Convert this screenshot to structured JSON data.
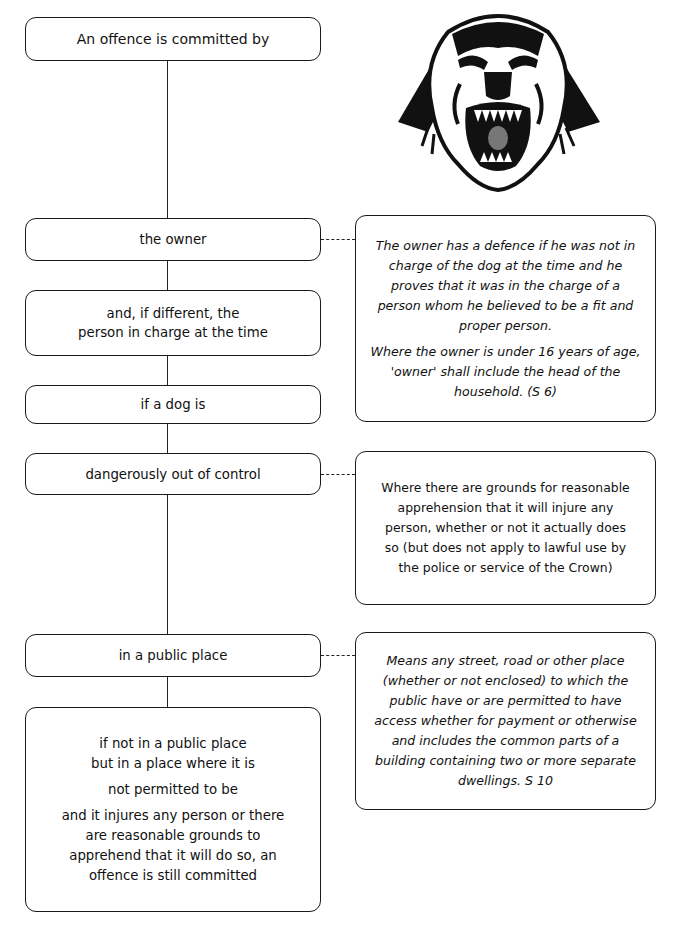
{
  "diagram": {
    "main_flow": [
      {
        "id": "start",
        "lines": [
          "An offence is committed by"
        ]
      },
      {
        "id": "owner",
        "lines": [
          "the owner"
        ]
      },
      {
        "id": "person-in-charge",
        "lines": [
          "and, if different, the",
          "person in charge at the time"
        ]
      },
      {
        "id": "if-dog",
        "lines": [
          "if a dog is"
        ]
      },
      {
        "id": "out-of-control",
        "lines": [
          "dangerously out of control"
        ]
      },
      {
        "id": "public-place",
        "lines": [
          "in a public place"
        ]
      },
      {
        "id": "not-permitted",
        "paragraphs": [
          "if not in a public place but in a place where it is",
          "not permitted to be",
          "and it injures any person or there are reasonable grounds to apprehend that it will do so, an offence is still committed"
        ]
      }
    ],
    "notes": [
      {
        "id": "owner-defence",
        "attached_to": "owner",
        "style": "italic",
        "paragraphs": [
          "The owner has a defence if he was not in charge of the dog at the time and he proves that it was in the charge of a person whom he believed to be a fit and proper person.",
          "Where the owner is under 16 years of age, 'owner' shall include the head of the household.  (S 6)"
        ]
      },
      {
        "id": "out-of-control-definition",
        "attached_to": "out-of-control",
        "style": "normal",
        "paragraphs": [
          "Where there are grounds for reasonable apprehension that it will injure any person, whether or not it actually does so (but does not apply to lawful use by the police or service of the Crown)"
        ]
      },
      {
        "id": "public-place-definition",
        "attached_to": "public-place",
        "style": "italic",
        "paragraphs": [
          "Means any street, road or other place (whether or not enclosed) to which the public have or are permitted to have access whether for payment or otherwise and includes the common parts of a building containing two or more separate dwellings.  S 10"
        ]
      }
    ],
    "illustration": {
      "icon": "snarling-dog-head-icon"
    }
  }
}
